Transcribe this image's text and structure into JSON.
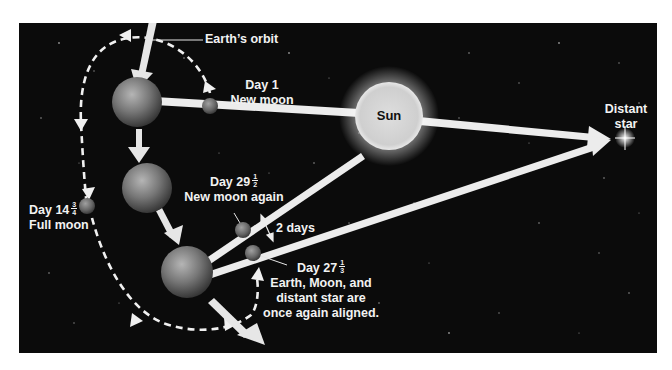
{
  "diagram": {
    "colors": {
      "background": "#0b0b0b",
      "page": "#ffffff",
      "arrow": "#e8e8e8",
      "sun": "#d9d9d9",
      "earth": "#7a7a7a",
      "moon": "#6e6e6e",
      "label": "#f2f2f2"
    },
    "labels": {
      "earth_orbit": "Earth’s orbit",
      "day1_line1": "Day 1",
      "day1_line2": "New moon",
      "sun": "Sun",
      "distant_star_line1": "Distant",
      "distant_star_line2": "star",
      "day29_prefix": "Day 29",
      "day29_num": "1",
      "day29_den": "2",
      "day29_line2": "New moon again",
      "day14_prefix": "Day 14",
      "day14_num": "3",
      "day14_den": "4",
      "day14_line2": "Full moon",
      "two_days": "2 days",
      "day27_prefix": "Day 27",
      "day27_num": "1",
      "day27_den": "3",
      "day27_line2": "Earth, Moon, and",
      "day27_line3": "distant star are",
      "day27_line4": "once again aligned."
    },
    "bodies": [
      {
        "name": "Earth (Day 1)",
        "type": "earth"
      },
      {
        "name": "Moon (Day 1, new moon)",
        "type": "moon"
      },
      {
        "name": "Earth (mid-orbit)",
        "type": "earth"
      },
      {
        "name": "Moon (Day 14 3/4, full moon)",
        "type": "moon"
      },
      {
        "name": "Earth (Day 27-29)",
        "type": "earth"
      },
      {
        "name": "Moon (Day 29 1/2, new moon again)",
        "type": "moon"
      },
      {
        "name": "Moon (Day 27 1/3, aligned with star)",
        "type": "moon"
      },
      {
        "name": "Sun",
        "type": "sun"
      },
      {
        "name": "Distant star",
        "type": "star"
      }
    ]
  }
}
